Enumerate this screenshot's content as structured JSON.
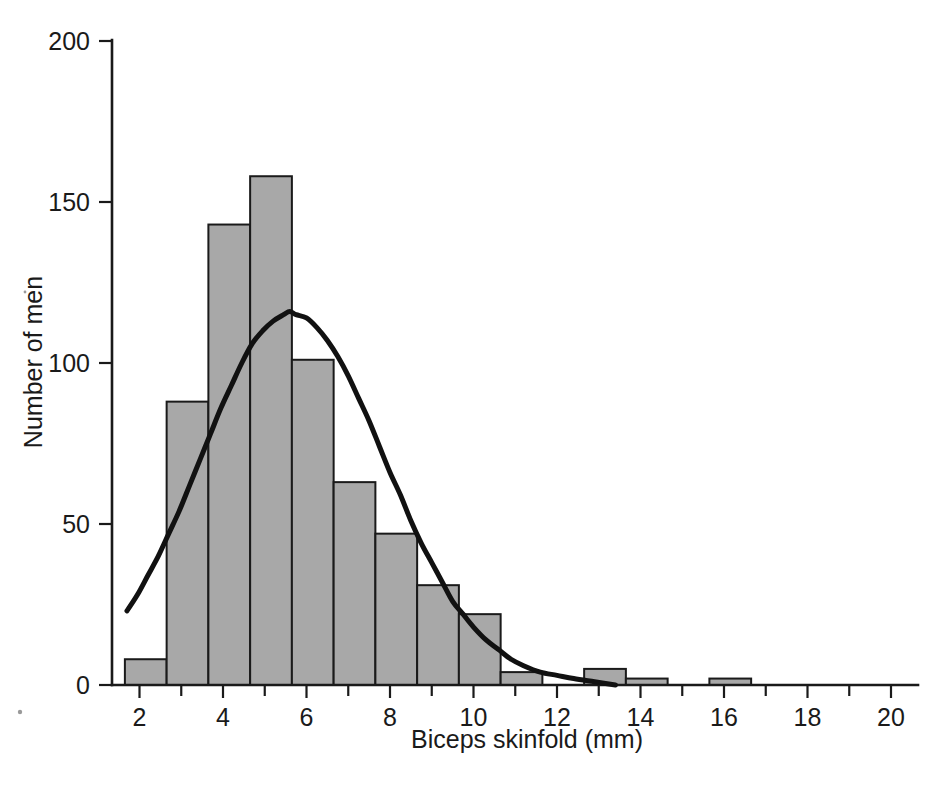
{
  "chart_data": {
    "type": "bar",
    "title": "",
    "subtitle": "",
    "xlabel": "Biceps skinfold (mm)",
    "ylabel": "Number of men",
    "xlim": [
      1.0,
      20.9
    ],
    "ylim": [
      0,
      200
    ],
    "grid": false,
    "legend": null,
    "bin_width": 1,
    "bin_starts": [
      1.65,
      2.65,
      3.65,
      4.65,
      5.65,
      6.65,
      7.65,
      8.65,
      9.65,
      10.65,
      11.65,
      12.65,
      13.65,
      14.65,
      15.65,
      16.65,
      17.65,
      18.65,
      19.65
    ],
    "categories": [
      "1.65-2.65",
      "2.65-3.65",
      "3.65-4.65",
      "4.65-5.65",
      "5.65-6.65",
      "6.65-7.65",
      "7.65-8.65",
      "8.65-9.65",
      "9.65-10.65",
      "10.65-11.65",
      "11.65-12.65",
      "12.65-13.65",
      "13.65-14.65",
      "14.65-15.65",
      "15.65-16.65",
      "16.65-17.65",
      "17.65-18.65",
      "18.65-19.65",
      "19.65-20.65"
    ],
    "values": [
      8,
      88,
      143,
      158,
      101,
      63,
      47,
      31,
      22,
      4,
      0,
      5,
      2,
      0,
      2,
      0,
      0,
      0,
      0
    ],
    "bar_fill_color": "#a8a8a8",
    "bar_edge_color": "#1a1a1a",
    "xticks_major": [
      2,
      4,
      6,
      8,
      10,
      12,
      14,
      16,
      18,
      20
    ],
    "xticks_minor": [
      3,
      5,
      7,
      9,
      11,
      13,
      15,
      17,
      19
    ],
    "xtick_labels": [
      "2",
      "4",
      "6",
      "8",
      "10",
      "12",
      "14",
      "16",
      "18",
      "20"
    ],
    "yticks": [
      0,
      50,
      100,
      150,
      200
    ],
    "ytick_labels": [
      "0",
      "50",
      "100",
      "150",
      "200"
    ],
    "overlay_curve": {
      "name": "fitted normal curve",
      "type": "line",
      "color": "#111111",
      "mean": 5.6,
      "sd": 2.2,
      "peak_value": 116,
      "x_start": 1.7,
      "x_end": 13.4,
      "points": [
        [
          1.7,
          23
        ],
        [
          1.95,
          28
        ],
        [
          2.2,
          34
        ],
        [
          2.45,
          40
        ],
        [
          2.7,
          47
        ],
        [
          2.95,
          54
        ],
        [
          3.2,
          62
        ],
        [
          3.45,
          70
        ],
        [
          3.7,
          78
        ],
        [
          3.95,
          86
        ],
        [
          4.2,
          93
        ],
        [
          4.45,
          100
        ],
        [
          4.7,
          106
        ],
        [
          4.95,
          110
        ],
        [
          5.2,
          113
        ],
        [
          5.45,
          115
        ],
        [
          5.6,
          116
        ],
        [
          5.75,
          115
        ],
        [
          6.0,
          114
        ],
        [
          6.25,
          111
        ],
        [
          6.5,
          107
        ],
        [
          6.75,
          102
        ],
        [
          7.0,
          96
        ],
        [
          7.25,
          89
        ],
        [
          7.5,
          82
        ],
        [
          7.75,
          74
        ],
        [
          8.0,
          66
        ],
        [
          8.25,
          59
        ],
        [
          8.5,
          51
        ],
        [
          8.75,
          44
        ],
        [
          9.0,
          38
        ],
        [
          9.25,
          32
        ],
        [
          9.5,
          26
        ],
        [
          9.75,
          22
        ],
        [
          10.0,
          18
        ],
        [
          10.3,
          14
        ],
        [
          10.6,
          11
        ],
        [
          10.9,
          8
        ],
        [
          11.2,
          6
        ],
        [
          11.6,
          4
        ],
        [
          12.0,
          3
        ],
        [
          12.4,
          2
        ],
        [
          12.9,
          1
        ],
        [
          13.4,
          0
        ]
      ]
    }
  },
  "axes": {
    "y_label": "Number of men",
    "x_label": "Biceps skinfold (mm)"
  },
  "ytick_labels": [
    "200",
    "150",
    "100",
    "50",
    "0"
  ],
  "xtick_labels": [
    "2",
    "4",
    "6",
    "8",
    "10",
    "12",
    "14",
    "16",
    "18",
    "20"
  ]
}
